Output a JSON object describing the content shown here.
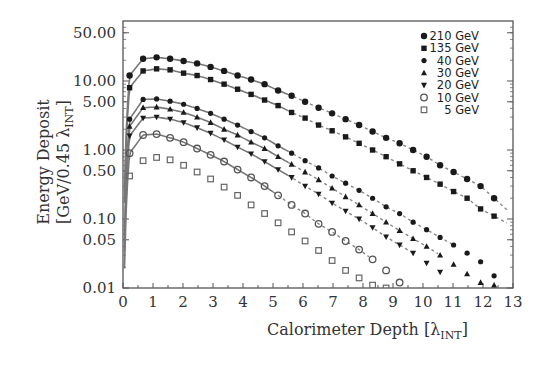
{
  "chart_data": {
    "type": "scatter",
    "title": "",
    "xlabel": "Calorimeter Depth [λINT]",
    "xlabel_main": "Calorimeter Depth [λ",
    "xlabel_sub": "INT",
    "xlabel_end": "]",
    "ylabel_line1": "Energy Deposit",
    "ylabel_line2_main": "[GeV/0.45 λ",
    "ylabel_line2_sub": "INT",
    "ylabel_line2_end": "]",
    "xlim": [
      0,
      13
    ],
    "ylim": [
      0.01,
      70
    ],
    "yscale": "log",
    "x_ticks": [
      0,
      1,
      2,
      3,
      4,
      5,
      6,
      7,
      8,
      9,
      10,
      11,
      12,
      13
    ],
    "y_ticks": [
      {
        "value": 50,
        "label": "50.00"
      },
      {
        "value": 10,
        "label": "10.00"
      },
      {
        "value": 5,
        "label": "5.00"
      },
      {
        "value": 1,
        "label": "1.00"
      },
      {
        "value": 0.5,
        "label": "0.50"
      },
      {
        "value": 0.1,
        "label": "0.10"
      },
      {
        "value": 0.05,
        "label": "0.05"
      },
      {
        "value": 0.01,
        "label": "0.01"
      }
    ],
    "grid": false,
    "legend_position": "upper right",
    "series": [
      {
        "name": "210 GeV",
        "marker": "filled-circle-large",
        "x": [
          0.22,
          0.67,
          1.12,
          1.57,
          2.02,
          2.47,
          2.92,
          3.37,
          3.82,
          4.27,
          4.72,
          5.17,
          5.62,
          6.07,
          6.52,
          6.97,
          7.42,
          7.87,
          8.32,
          8.77,
          9.22,
          9.67,
          10.12,
          10.57,
          11.02,
          11.47,
          11.92,
          12.37
        ],
        "y": [
          12,
          21,
          22,
          21,
          19.5,
          18,
          16,
          14,
          12,
          10.5,
          9,
          7.3,
          6.1,
          5.0,
          4.1,
          3.4,
          2.8,
          2.3,
          1.85,
          1.5,
          1.25,
          1.0,
          0.8,
          0.6,
          0.48,
          0.38,
          0.3,
          0.2
        ],
        "fit_solid_until": 5.5,
        "fit_dashed_until": 12.8
      },
      {
        "name": "135 GeV",
        "marker": "filled-square",
        "x": [
          0.22,
          0.67,
          1.12,
          1.57,
          2.02,
          2.47,
          2.92,
          3.37,
          3.82,
          4.27,
          4.72,
          5.17,
          5.62,
          6.07,
          6.52,
          6.97,
          7.42,
          7.87,
          8.32,
          8.77,
          9.22,
          9.67,
          10.12,
          10.57,
          11.02,
          11.47,
          11.92,
          12.37
        ],
        "y": [
          8,
          14,
          15,
          14.5,
          13,
          12,
          10.5,
          9,
          7.6,
          6.4,
          5.3,
          4.4,
          3.5,
          2.9,
          2.3,
          1.9,
          1.55,
          1.25,
          1.0,
          0.8,
          0.63,
          0.5,
          0.4,
          0.32,
          0.25,
          0.2,
          0.14,
          0.11
        ],
        "fit_solid_until": 5.5,
        "fit_dashed_until": 12.8
      },
      {
        "name": "40 GeV",
        "marker": "filled-diamond",
        "x": [
          0.22,
          0.67,
          1.12,
          1.57,
          2.02,
          2.47,
          2.92,
          3.37,
          3.82,
          4.27,
          4.72,
          5.17,
          5.62,
          6.07,
          6.52,
          6.97,
          7.42,
          7.87,
          8.32,
          8.77,
          9.22,
          9.67,
          10.12,
          10.57,
          11.02,
          11.47,
          11.92,
          12.37
        ],
        "y": [
          2.8,
          5.4,
          5.5,
          5.1,
          4.6,
          4.0,
          3.4,
          2.8,
          2.3,
          1.85,
          1.5,
          1.15,
          0.9,
          0.7,
          0.55,
          0.42,
          0.33,
          0.26,
          0.2,
          0.15,
          0.12,
          0.09,
          0.07,
          0.054,
          0.042,
          0.032,
          0.024,
          0.015
        ],
        "fit_solid_until": 5.5,
        "fit_dashed_until": 11.0
      },
      {
        "name": "30 GeV",
        "marker": "filled-triangle-up",
        "x": [
          0.22,
          0.67,
          1.12,
          1.57,
          2.02,
          2.47,
          2.92,
          3.37,
          3.82,
          4.27,
          4.72,
          5.17,
          5.62,
          6.07,
          6.52,
          6.97,
          7.42,
          7.87,
          8.32,
          8.77,
          9.22,
          9.67,
          10.12,
          10.57,
          11.02,
          11.47,
          11.92,
          12.37
        ],
        "y": [
          2.2,
          4.1,
          4.2,
          3.9,
          3.5,
          3.0,
          2.5,
          2.0,
          1.65,
          1.3,
          1.05,
          0.8,
          0.62,
          0.48,
          0.37,
          0.28,
          0.21,
          0.16,
          0.12,
          0.09,
          0.068,
          0.052,
          0.04,
          0.03,
          0.022,
          0.016,
          0.012,
          0.011
        ],
        "fit_solid_until": 5.5,
        "fit_dashed_until": 10.5
      },
      {
        "name": "20 GeV",
        "marker": "filled-triangle-down",
        "x": [
          0.22,
          0.67,
          1.12,
          1.57,
          2.02,
          2.47,
          2.92,
          3.37,
          3.82,
          4.27,
          4.72,
          5.17,
          5.62,
          6.07,
          6.52,
          6.97,
          7.42,
          7.87,
          8.32,
          8.77,
          9.22,
          9.67,
          10.12,
          10.57
        ],
        "y": [
          1.6,
          2.9,
          3.0,
          2.8,
          2.5,
          2.1,
          1.75,
          1.4,
          1.1,
          0.88,
          0.68,
          0.52,
          0.4,
          0.3,
          0.23,
          0.17,
          0.13,
          0.1,
          0.075,
          0.055,
          0.042,
          0.032,
          0.023,
          0.017
        ],
        "fit_solid_until": 5.5,
        "fit_dashed_until": 9.6
      },
      {
        "name": "10 GeV",
        "marker": "open-circle",
        "x": [
          0.22,
          0.67,
          1.12,
          1.57,
          2.02,
          2.47,
          2.92,
          3.37,
          3.82,
          4.27,
          4.72,
          5.17,
          5.62,
          6.07,
          6.52,
          6.97,
          7.42,
          7.87,
          8.32,
          8.77,
          9.22
        ],
        "y": [
          0.9,
          1.65,
          1.7,
          1.5,
          1.3,
          1.05,
          0.85,
          0.68,
          0.52,
          0.4,
          0.3,
          0.22,
          0.16,
          0.12,
          0.085,
          0.065,
          0.048,
          0.036,
          0.026,
          0.018,
          0.012
        ],
        "fit_solid_until": 5.0,
        "fit_dashed_until": 8.2
      },
      {
        "name": "5 GeV",
        "marker": "open-square",
        "x": [
          0.22,
          0.67,
          1.12,
          1.57,
          2.02,
          2.47,
          2.92,
          3.37,
          3.82,
          4.27,
          4.72,
          5.17,
          5.62,
          6.07,
          6.52,
          6.97,
          7.42,
          7.87,
          8.32,
          8.77
        ],
        "y": [
          0.42,
          0.7,
          0.78,
          0.72,
          0.6,
          0.48,
          0.38,
          0.29,
          0.22,
          0.16,
          0.12,
          0.088,
          0.065,
          0.048,
          0.035,
          0.025,
          0.018,
          0.014,
          0.011,
          0.01
        ],
        "fit_solid_until": null,
        "fit_dashed_until": null
      }
    ]
  }
}
